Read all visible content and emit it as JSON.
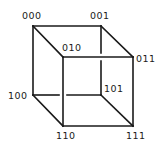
{
  "diagram": {
    "type": "binary-hypercube-3d",
    "colors": {
      "stroke": "#1a1a1a",
      "background": "#ffffff"
    },
    "vertices": [
      {
        "id": "000",
        "label": "000",
        "x": 33,
        "y": 26
      },
      {
        "id": "001",
        "label": "001",
        "x": 101,
        "y": 26
      },
      {
        "id": "010",
        "label": "010",
        "x": 63,
        "y": 57
      },
      {
        "id": "011",
        "label": "011",
        "x": 133,
        "y": 57
      },
      {
        "id": "100",
        "label": "100",
        "x": 33,
        "y": 95
      },
      {
        "id": "101",
        "label": "101",
        "x": 101,
        "y": 95
      },
      {
        "id": "110",
        "label": "110",
        "x": 63,
        "y": 126
      },
      {
        "id": "111",
        "label": "111",
        "x": 133,
        "y": 126
      }
    ],
    "edges": [
      [
        "000",
        "001"
      ],
      [
        "000",
        "010"
      ],
      [
        "000",
        "100"
      ],
      [
        "001",
        "011"
      ],
      [
        "001",
        "101"
      ],
      [
        "010",
        "011"
      ],
      [
        "010",
        "110"
      ],
      [
        "011",
        "111"
      ],
      [
        "100",
        "101"
      ],
      [
        "100",
        "110"
      ],
      [
        "101",
        "111"
      ],
      [
        "110",
        "111"
      ]
    ]
  }
}
